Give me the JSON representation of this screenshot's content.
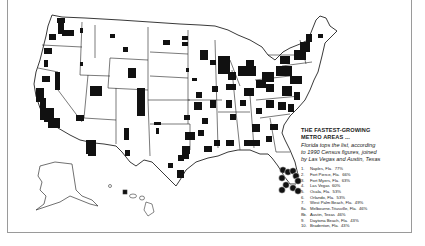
{
  "map": {
    "subject": "United States metro areas (shaded black)",
    "colors": {
      "background": "#ffffff",
      "metro_fill": "#111111",
      "border_lines": "#222222",
      "frame": "#9a9a9a"
    },
    "regions_shown": [
      "Contiguous United States",
      "Alaska",
      "Hawaii"
    ],
    "highlight": "Florida metro areas marked with numbered circles"
  },
  "legend": {
    "title_line1": "THE FASTEST-GROWING",
    "title_line2": "METRO AREAS ...",
    "subtitle_line1": "Florida tops the list, according",
    "subtitle_line2": "to 1990 Census figures, joined",
    "subtitle_line3": "by Las Vegas and Austin, Texas",
    "items": [
      {
        "rank": "1.",
        "name": "Naples, Fla.",
        "value": "77%"
      },
      {
        "rank": "2.",
        "name": "Fort Pierce, Fla.",
        "value": "66%"
      },
      {
        "rank": "3.",
        "name": "Fort Myers, Fla.",
        "value": "63%"
      },
      {
        "rank": "4.",
        "name": "Las Vegas",
        "value": "60%"
      },
      {
        "rank": "5.",
        "name": "Ocala, Fla.",
        "value": "53%"
      },
      {
        "rank": "6.",
        "name": "Orlando, Fla.",
        "value": "53%"
      },
      {
        "rank": "7.",
        "name": "West Palm Beach, Fla.",
        "value": "49%"
      },
      {
        "rank": "8a.",
        "name": "Melbourne-Titusville, Fla.",
        "value": "46%"
      },
      {
        "rank": "8b.",
        "name": "Austin, Texas",
        "value": "46%"
      },
      {
        "rank": "9.",
        "name": "Daytona Beach, Fla.",
        "value": "43%"
      },
      {
        "rank": "10.",
        "name": "Bradenton, Fla.",
        "value": "43%"
      }
    ]
  }
}
